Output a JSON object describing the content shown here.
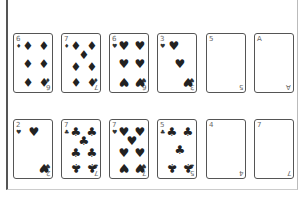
{
  "header": {
    "title": ""
  },
  "colors": {
    "border": "#555555",
    "pip": "#222222",
    "rank": "#666666",
    "background": "#ffffff"
  },
  "rows": [
    {
      "cards": [
        {
          "rank": "6",
          "suit": "diamonds",
          "symbol": "♦",
          "face_up": true
        },
        {
          "rank": "7",
          "suit": "diamonds",
          "symbol": "♦",
          "face_up": true
        },
        {
          "rank": "6",
          "suit": "hearts",
          "symbol": "♥",
          "face_up": true
        },
        {
          "rank": "3",
          "suit": "hearts",
          "symbol": "♥",
          "face_up": true
        },
        {
          "rank": "5",
          "suit": "",
          "symbol": "",
          "face_up": true
        },
        {
          "rank": "A",
          "suit": "",
          "symbol": "",
          "face_up": true
        }
      ]
    },
    {
      "cards": [
        {
          "rank": "2",
          "suit": "hearts",
          "symbol": "♥",
          "face_up": true
        },
        {
          "rank": "7",
          "suit": "clubs",
          "symbol": "♣",
          "face_up": true
        },
        {
          "rank": "7",
          "suit": "hearts",
          "symbol": "♥",
          "face_up": true
        },
        {
          "rank": "5",
          "suit": "clubs",
          "symbol": "♣",
          "face_up": true
        },
        {
          "rank": "4",
          "suit": "",
          "symbol": "",
          "face_up": true
        },
        {
          "rank": "7",
          "suit": "",
          "symbol": "",
          "face_up": true
        }
      ]
    }
  ]
}
